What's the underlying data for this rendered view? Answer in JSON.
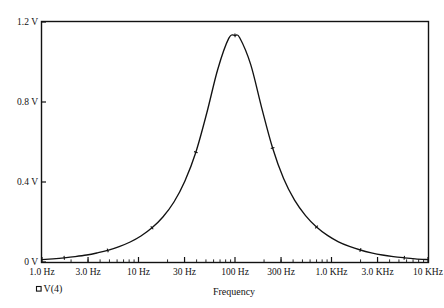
{
  "chart_data": {
    "type": "line",
    "title": "",
    "xlabel": "Frequency",
    "ylabel": "",
    "xscale": "log",
    "xlim": [
      1,
      10000
    ],
    "ylim": [
      0,
      1.2
    ],
    "grid": false,
    "legend_position": "bottom-left",
    "x_tick_labels": [
      "1.0 Hz",
      "3.0 Hz",
      "10 Hz",
      "30 Hz",
      "100 Hz",
      "300 Hz",
      "1.0 KHz",
      "3.0 KHz",
      "10 KHz"
    ],
    "x_tick_values": [
      1,
      3,
      10,
      30,
      100,
      300,
      1000,
      3000,
      10000
    ],
    "y_tick_labels": [
      "0 V",
      "0.4 V",
      "0.8 V",
      "1.2 V"
    ],
    "y_tick_values": [
      0,
      0.4,
      0.8,
      1.2
    ],
    "series": [
      {
        "name": "V(4)",
        "marker": "square",
        "color": "#121212",
        "x": [
          1,
          1.3,
          1.7,
          2.2,
          2.9,
          3.7,
          4.8,
          6.3,
          8.2,
          10.6,
          13.8,
          17.9,
          23.3,
          30.2,
          39.3,
          51.0,
          66.3,
          86.1,
          100,
          111.9,
          145.3,
          188.8,
          245.3,
          318.7,
          414.1,
          538.1,
          699.2,
          908.4,
          1180.3,
          1533.6,
          1992.6,
          2588.8,
          3363.2,
          4369.7,
          5677.3,
          7376.1,
          10000
        ],
        "y": [
          0.012,
          0.016,
          0.021,
          0.027,
          0.035,
          0.045,
          0.058,
          0.077,
          0.1,
          0.13,
          0.171,
          0.225,
          0.3,
          0.404,
          0.549,
          0.745,
          0.964,
          1.118,
          1.133,
          1.121,
          0.988,
          0.772,
          0.57,
          0.417,
          0.309,
          0.232,
          0.175,
          0.133,
          0.101,
          0.078,
          0.06,
          0.046,
          0.035,
          0.027,
          0.021,
          0.016,
          0.012
        ]
      }
    ]
  },
  "legend": {
    "entries": [
      {
        "marker_name": "square-marker",
        "label": "V(4)"
      }
    ]
  },
  "axis": {
    "x_title": "Frequency"
  }
}
